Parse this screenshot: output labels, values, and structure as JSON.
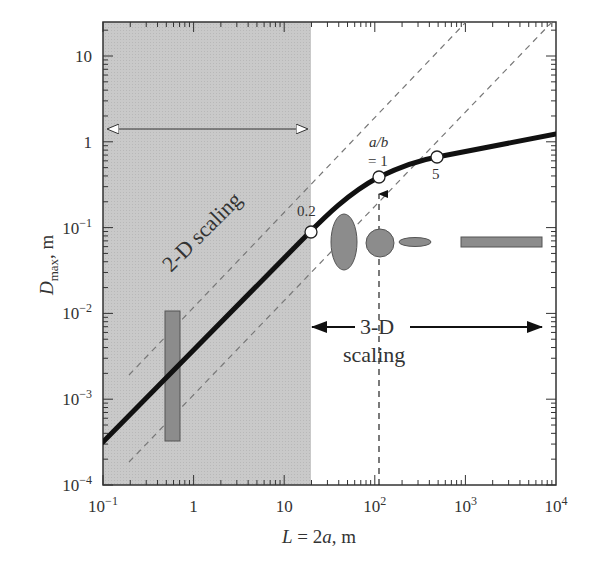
{
  "chart_data": {
    "type": "line",
    "title": "",
    "xlabel": "L = 2a, m",
    "ylabel": "D_max, m",
    "xscale": "log",
    "yscale": "log",
    "xlim": [
      0.1,
      10000
    ],
    "ylim": [
      0.0001,
      25
    ],
    "x_ticks": [
      "10^-1",
      "1",
      "10",
      "10^2",
      "10^3",
      "10^4"
    ],
    "y_ticks": [
      "10^-4",
      "10^-3",
      "10^-2",
      "10^-1",
      "1",
      "10"
    ],
    "grid": false,
    "series": [
      {
        "name": "D_max vs L (thick curve)",
        "style": "solid-thick",
        "x": [
          0.1,
          1,
          10,
          30,
          100,
          200,
          500,
          1000,
          3000,
          10000
        ],
        "y": [
          0.00032,
          0.0029,
          0.027,
          0.083,
          0.22,
          0.36,
          0.52,
          0.62,
          0.82,
          1.12
        ]
      },
      {
        "name": "upper dashed reference (slope 1)",
        "style": "dashed",
        "x": [
          0.2,
          800
        ],
        "y": [
          0.0018,
          25
        ]
      },
      {
        "name": "lower dashed reference (slope 1)",
        "style": "dashed",
        "x": [
          0.2,
          9000
        ],
        "y": [
          0.00018,
          22
        ]
      }
    ],
    "markers": [
      {
        "label": "0.2",
        "x": 30,
        "y": 0.083
      },
      {
        "label": "a/b = 1",
        "x": 200,
        "y": 0.36
      },
      {
        "label": "5",
        "x": 1000,
        "y": 0.62
      }
    ],
    "regions": [
      {
        "name": "2-D scaling",
        "x_range": [
          0.1,
          30
        ],
        "fill": "#c8c8c8"
      },
      {
        "name": "3-D scaling",
        "x_range": [
          30,
          10000
        ]
      }
    ],
    "data_bars": [
      {
        "name": "vertical data range bar",
        "x": 0.65,
        "y_range": [
          0.0003,
          0.011
        ]
      },
      {
        "name": "horizontal data range bar",
        "x_range": [
          2000,
          8000
        ],
        "y": 0.073
      }
    ],
    "annotations": [
      "2-D scaling",
      "3-D scaling",
      "a/b",
      "= 1",
      "0.2",
      "5"
    ],
    "shape_glyphs": [
      "tall ellipse",
      "circle",
      "flat ellipse",
      "long rectangle"
    ]
  },
  "labels": {
    "xlabel_L": "L",
    "xlabel_rest": " = 2",
    "xlabel_a": "a",
    "xlabel_unit": ", m",
    "ylabel_D": "D",
    "ylabel_sub": "max",
    "ylabel_unit": ", m",
    "two_d": "2-D scaling",
    "three_d_top": "3-D",
    "three_d_bottom": "scaling",
    "ab_top": "a/b",
    "ab_bottom": "= 1",
    "pt_02": "0.2",
    "pt_5": "5"
  },
  "ticks": {
    "x": [
      {
        "base": "10",
        "exp": "−1"
      },
      {
        "base": "1",
        "exp": ""
      },
      {
        "base": "10",
        "exp": ""
      },
      {
        "base": "10",
        "exp": "2"
      },
      {
        "base": "10",
        "exp": "3"
      },
      {
        "base": "10",
        "exp": "4"
      }
    ],
    "y": [
      {
        "base": "10",
        "exp": "−4"
      },
      {
        "base": "10",
        "exp": "−3"
      },
      {
        "base": "10",
        "exp": "−2"
      },
      {
        "base": "10",
        "exp": "−1"
      },
      {
        "base": "1",
        "exp": ""
      },
      {
        "base": "10",
        "exp": ""
      }
    ]
  },
  "colors": {
    "shade": "#c9c9c9",
    "glyph_fill": "#8c8c8c",
    "curve": "#111111",
    "dashed": "#777777"
  }
}
